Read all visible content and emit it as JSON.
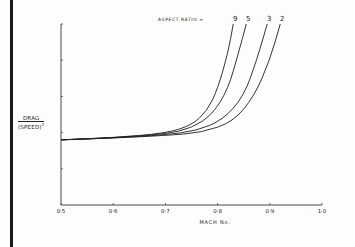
{
  "chart_data": {
    "type": "line",
    "title": "",
    "xlabel": "MACH No.",
    "ylabel": "DRAG / (SPEED)²",
    "xlim": [
      0.5,
      1.0
    ],
    "ylim": [
      0,
      5
    ],
    "x_ticks": [
      "0·5",
      "0·6",
      "0·7",
      "0·8",
      "0·9",
      "1·0"
    ],
    "y_ticks_labeled": false,
    "y_tick_count": 5,
    "grid": false,
    "legend": {
      "title": "ASPECT RATIO =",
      "entries": [
        "9",
        "5",
        "3",
        "2"
      ],
      "position": "top, labels at curve ends"
    },
    "series": [
      {
        "name": "9",
        "x": [
          0.5,
          0.6,
          0.7,
          0.75,
          0.78,
          0.8,
          0.82,
          0.83
        ],
        "y": [
          1.8,
          1.86,
          1.98,
          2.2,
          2.6,
          3.2,
          4.2,
          5.0
        ]
      },
      {
        "name": "5",
        "x": [
          0.5,
          0.6,
          0.7,
          0.75,
          0.79,
          0.82,
          0.84,
          0.855
        ],
        "y": [
          1.8,
          1.86,
          1.96,
          2.12,
          2.5,
          3.2,
          4.2,
          5.0
        ]
      },
      {
        "name": "3",
        "x": [
          0.5,
          0.6,
          0.7,
          0.76,
          0.81,
          0.85,
          0.875,
          0.895
        ],
        "y": [
          1.8,
          1.85,
          1.94,
          2.05,
          2.35,
          3.0,
          4.0,
          5.0
        ]
      },
      {
        "name": "2",
        "x": [
          0.5,
          0.6,
          0.7,
          0.77,
          0.83,
          0.87,
          0.9,
          0.92
        ],
        "y": [
          1.8,
          1.85,
          1.92,
          2.0,
          2.3,
          3.0,
          4.0,
          5.0
        ]
      }
    ]
  },
  "labels": {
    "legend_title": "ASPECT RATIO =",
    "ar": [
      "9",
      "5",
      "3",
      "2"
    ],
    "x_ticks": [
      "0·5",
      "0·6",
      "0·7",
      "0·8",
      "0·9",
      "1·0"
    ],
    "xlabel": "MACH No.",
    "ylabel_num": "DRAG",
    "ylabel_den": "(SPEED)",
    "ylabel_exp": "2"
  }
}
